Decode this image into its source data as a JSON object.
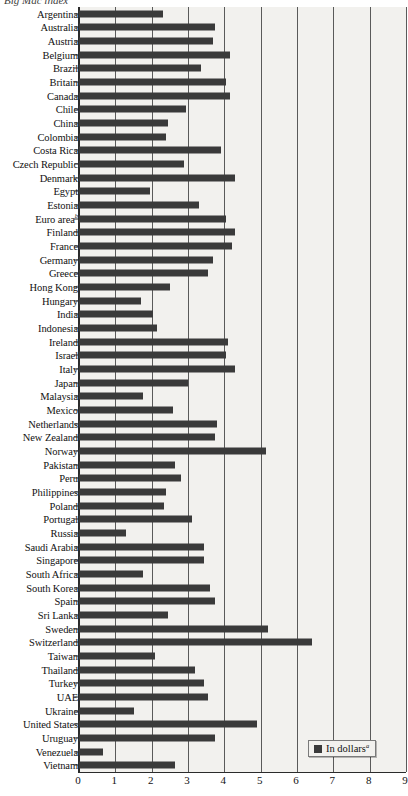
{
  "caption": {
    "clipped_top_text": "Big Mac index"
  },
  "legend": {
    "label": "In dollars",
    "superscript": "a",
    "swatch_color": "#3a3a3a",
    "position": "bottom-right"
  },
  "axis": {
    "x_ticks": [
      "0",
      "1",
      "2",
      "3",
      "4",
      "5",
      "6",
      "7",
      "8",
      "9"
    ],
    "xmin": 0,
    "xmax": 9,
    "xlabel": "",
    "ylabel": "",
    "grid": true
  },
  "colors": {
    "bar": "#3a3a3a",
    "plot_background": "#f2f1ee",
    "gridline": "#5a5a5a",
    "axis": "#2b2b2b",
    "text": "#111111"
  },
  "chart_data": {
    "type": "bar",
    "orientation": "horizontal",
    "title": "Big Mac index",
    "xlabel": "In dollars",
    "ylabel": "",
    "xlim": [
      0,
      9
    ],
    "grid": true,
    "legend": [
      "In dollars"
    ],
    "series": [
      {
        "name": "In dollars",
        "color": "#3a3a3a",
        "values": [
          2.3,
          3.75,
          3.7,
          4.15,
          3.35,
          4.05,
          4.15,
          2.95,
          2.45,
          2.4,
          3.9,
          2.9,
          4.3,
          1.95,
          3.3,
          4.05,
          4.3,
          4.2,
          3.7,
          3.55,
          2.5,
          1.7,
          2.05,
          2.15,
          4.1,
          4.05,
          4.3,
          3.0,
          1.75,
          2.6,
          3.8,
          3.75,
          5.15,
          2.65,
          2.8,
          2.4,
          2.35,
          3.1,
          1.3,
          3.45,
          3.45,
          1.75,
          3.6,
          3.75,
          2.45,
          5.2,
          6.4,
          2.1,
          3.2,
          3.45,
          3.55,
          1.5,
          4.9,
          3.75,
          0.65,
          2.65
        ]
      }
    ],
    "categories": [
      "Argentina",
      "Australia",
      "Austria",
      "Belgium",
      "Brazil",
      "Britain",
      "Canada",
      "Chile",
      "China",
      "Colombia",
      "Costa Rica",
      "Czech Republic",
      "Denmark",
      "Egypt",
      "Estonia",
      "Euro area",
      "Finland",
      "France",
      "Germany",
      "Greece",
      "Hong Kong",
      "Hungary",
      "India",
      "Indonesia",
      "Ireland",
      "Israel",
      "Italy",
      "Japan",
      "Malaysia",
      "Mexico",
      "Netherlands",
      "New Zealand",
      "Norway",
      "Pakistan",
      "Peru",
      "Philippines",
      "Poland",
      "Portugal",
      "Russia",
      "Saudi Arabia",
      "Singapore",
      "South Africa",
      "South Korea",
      "Spain",
      "Sri Lanka",
      "Sweden",
      "Switzerland",
      "Taiwan",
      "Thailand",
      "Turkey",
      "UAE",
      "Ukraine",
      "United States",
      "Uruguay",
      "Venezuela",
      "Vietnam"
    ],
    "category_notes": {
      "Euro area": "b"
    }
  }
}
